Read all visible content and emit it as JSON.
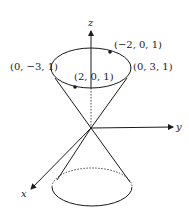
{
  "diagram": {
    "axes": {
      "x_label": "x",
      "y_label": "y",
      "z_label": "z"
    },
    "points": [
      {
        "label": "(0, −3, 1)",
        "role": "left-of-top-ellipse"
      },
      {
        "label": "(−2, 0, 1)",
        "role": "back-point-on-top-ellipse"
      },
      {
        "label": "(0, 3, 1)",
        "role": "right-of-top-ellipse"
      },
      {
        "label": "(2, 0, 1)",
        "role": "front-point-on-top-ellipse"
      }
    ],
    "colors": {
      "stroke": "#1a1a1a",
      "background": "#ffffff"
    }
  }
}
